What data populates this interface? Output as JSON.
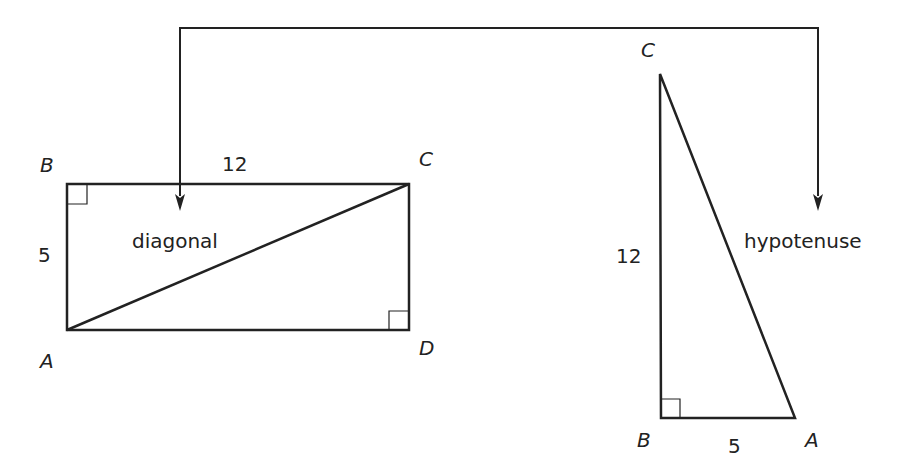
{
  "diagram": {
    "rectangle": {
      "vertices": {
        "A": "A",
        "B": "B",
        "C": "C",
        "D": "D"
      },
      "side_top": "12",
      "side_left": "5",
      "diagonal_label": "diagonal"
    },
    "triangle": {
      "vertices": {
        "C": "C",
        "B": "B",
        "A": "A"
      },
      "side_vertical": "12",
      "side_bottom": "5",
      "hypotenuse_label": "hypotenuse"
    }
  },
  "colors": {
    "stroke": "#222222",
    "background": "#ffffff"
  }
}
